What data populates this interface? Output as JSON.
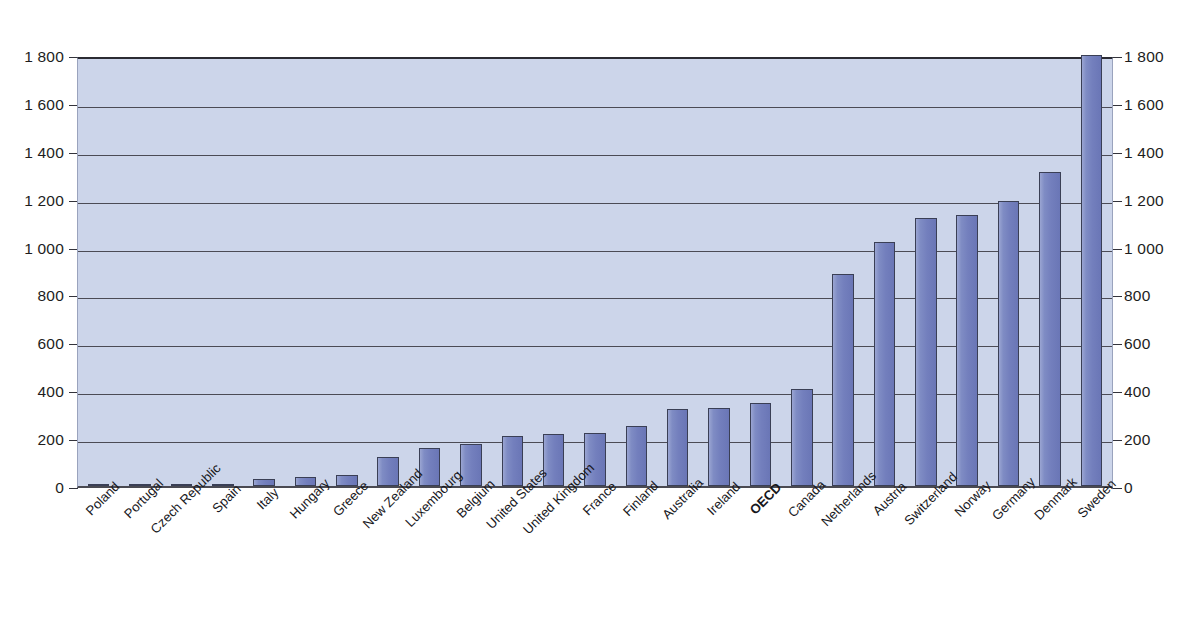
{
  "chart_data": {
    "type": "bar",
    "title": "",
    "subtitle": "",
    "xlabel": "",
    "ylabel": "",
    "ylim": [
      0,
      1800
    ],
    "ytick_step": 200,
    "grid": true,
    "legend": "none",
    "dual_y_axis": true,
    "thousands_separator": " ",
    "highlight_category": "OECD",
    "bar_color": "#7b87c4",
    "bar_border_color": "#3a3f55",
    "plot_background": "#ccd5ea",
    "y_tick_labels": [
      "1 800",
      "1 600",
      "1 400",
      "1 200",
      "1 000",
      "800",
      "600",
      "400",
      "200",
      "0"
    ],
    "y_tick_values": [
      1800,
      1600,
      1400,
      1200,
      1000,
      800,
      600,
      400,
      200,
      0
    ],
    "categories": [
      "Poland",
      "Portugal",
      "Czech Republic",
      "Spain",
      "Italy",
      "Hungary",
      "Greece",
      "New Zealand",
      "Luxembourg",
      "Belgium",
      "United States",
      "United Kingdom",
      "France",
      "Finland",
      "Australia",
      "Ireland",
      "OECD",
      "Canada",
      "Netherlands",
      "Austria",
      "Switzerland",
      "Norway",
      "Germany",
      "Denmark",
      "Sweden"
    ],
    "values": [
      1,
      3,
      7,
      10,
      28,
      38,
      46,
      122,
      160,
      175,
      208,
      218,
      222,
      252,
      320,
      325,
      348,
      405,
      885,
      1020,
      1120,
      1130,
      1190,
      1310,
      1800
    ]
  }
}
